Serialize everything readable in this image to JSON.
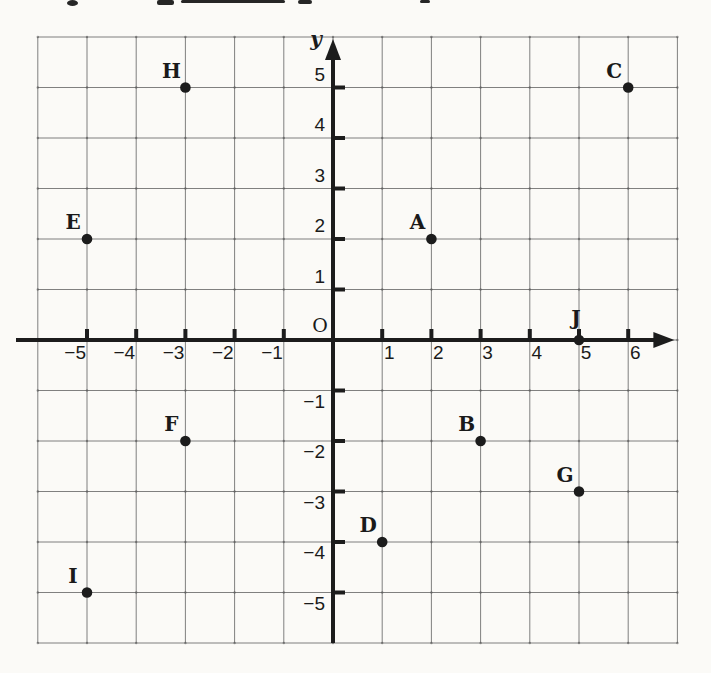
{
  "chart_data": {
    "type": "scatter",
    "points": [
      {
        "label": "A",
        "x": 2,
        "y": 2
      },
      {
        "label": "B",
        "x": 3,
        "y": -2
      },
      {
        "label": "C",
        "x": 6,
        "y": 5
      },
      {
        "label": "D",
        "x": 1,
        "y": -4
      },
      {
        "label": "E",
        "x": -5,
        "y": 2
      },
      {
        "label": "F",
        "x": -3,
        "y": -2
      },
      {
        "label": "G",
        "x": 5,
        "y": -3
      },
      {
        "label": "H",
        "x": -3,
        "y": 5
      },
      {
        "label": "I",
        "x": -5,
        "y": -5
      },
      {
        "label": "J",
        "x": 5,
        "y": 0,
        "label_dx": -3,
        "label_dy": -15
      }
    ],
    "axes": {
      "x_range": [
        -6,
        7
      ],
      "y_range": [
        -6,
        6
      ],
      "x_ticks": [
        -5,
        -4,
        -3,
        -2,
        -1,
        1,
        2,
        3,
        4,
        5,
        6
      ],
      "y_ticks": [
        -5,
        -4,
        -3,
        -2,
        -1,
        1,
        2,
        3,
        4,
        5
      ],
      "y_axis_label": "y",
      "origin_label": "O",
      "grid": true
    },
    "colors": {
      "ink": "#1c1c1c",
      "grid": "#6b6b6b",
      "paper": "#fbfaf7"
    }
  }
}
